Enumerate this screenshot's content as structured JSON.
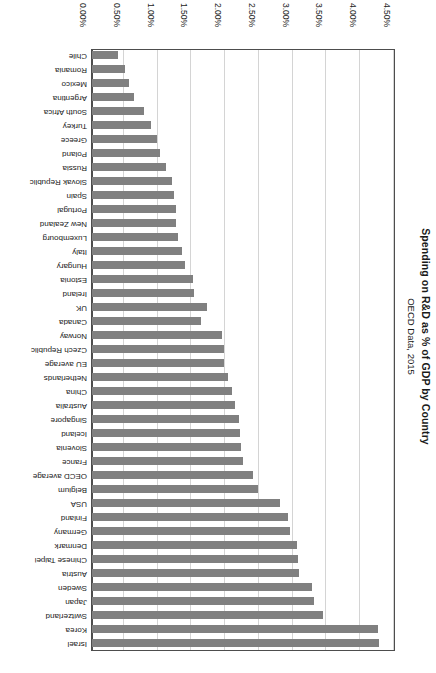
{
  "chart_data": {
    "type": "bar",
    "orientation": "horizontal",
    "title": "Spending on R&D as % of GDP by Country",
    "subtitle": "OECD Data, 2015",
    "xlabel": "",
    "ylabel": "",
    "xlim": [
      0,
      4.5
    ],
    "grid": true,
    "legend": "none",
    "rotated_180": true,
    "bar_color": "#808080",
    "plot_border_color": "#4d4d4d",
    "gridline_color": "#d4d4d4",
    "tick_labels": [
      "4.50%",
      "4.00%",
      "3.50%",
      "3.00%",
      "2.50%",
      "2.00%",
      "1.50%",
      "1.00%",
      "0.50%",
      "0.00%"
    ],
    "tick_values": [
      4.5,
      4.0,
      3.5,
      3.0,
      2.5,
      2.0,
      1.5,
      1.0,
      0.5,
      0.0
    ],
    "categories": [
      "Israel",
      "Korea",
      "Switzerland",
      "Japan",
      "Sweden",
      "Austria",
      "Chinese Taipei",
      "Denmark",
      "Germany",
      "Finland",
      "USA",
      "Belgium",
      "OECD average",
      "France",
      "Slovenia",
      "Iceland",
      "Singapore",
      "Australia",
      "China",
      "Netherlands",
      "EU average",
      "Czech Republic",
      "Norway",
      "Canada",
      "UK",
      "Ireland",
      "Estonia",
      "Hungary",
      "Italy",
      "Luxembourg",
      "New Zealand",
      "Portugal",
      "Spain",
      "Slovak Republic",
      "Russia",
      "Poland",
      "Greece",
      "Turkey",
      "South Africa",
      "Argentina",
      "Mexico",
      "Romania",
      "Chile"
    ],
    "values": [
      4.25,
      4.23,
      3.42,
      3.29,
      3.26,
      3.07,
      3.05,
      3.03,
      2.93,
      2.9,
      2.79,
      2.46,
      2.38,
      2.23,
      2.21,
      2.19,
      2.18,
      2.12,
      2.07,
      2.01,
      1.96,
      1.95,
      1.93,
      1.61,
      1.7,
      1.51,
      1.49,
      1.38,
      1.33,
      1.27,
      1.25,
      1.24,
      1.22,
      1.18,
      1.1,
      1.0,
      0.96,
      0.88,
      0.77,
      0.62,
      0.55,
      0.49,
      0.39
    ]
  }
}
